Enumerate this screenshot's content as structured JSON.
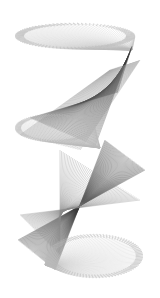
{
  "image": {
    "description": "String-art style twisted helical ribbon made of gray radial lines on white background",
    "background": "#ffffff",
    "colors": {
      "light": "#b8b8b8",
      "mid": "#8a8a8a",
      "dark": "#3a3a3a"
    },
    "segments": [
      {
        "cx1": 75,
        "cy1": 38,
        "rx1": 62,
        "ry1": 14,
        "cx2": 130,
        "cy2": 50,
        "kind": "disk",
        "shade": "light"
      },
      {
        "cx1": 128,
        "cy1": 52,
        "cx2": 70,
        "cy2": 140,
        "kind": "ribbon",
        "shade": "dark"
      },
      {
        "cx1": 60,
        "cy1": 130,
        "rx1": 45,
        "ry1": 16,
        "kind": "disk",
        "shade": "light"
      },
      {
        "cx1": 100,
        "cy1": 150,
        "cx2": 40,
        "cy2": 250,
        "kind": "ribbon",
        "shade": "dark"
      },
      {
        "cx1": 95,
        "cy1": 256,
        "rx1": 48,
        "ry1": 22,
        "kind": "disk",
        "shade": "light"
      }
    ]
  }
}
